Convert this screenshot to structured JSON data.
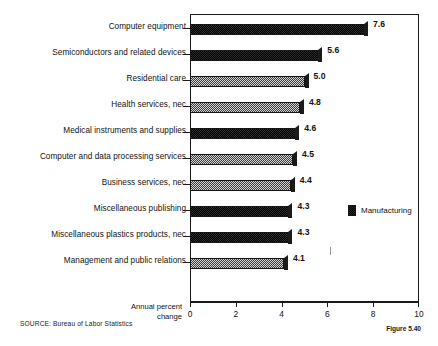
{
  "chart_data": {
    "type": "bar",
    "orientation": "horizontal",
    "title": "",
    "xlabel": "Annual percent change",
    "ylabel": "",
    "xlim": [
      0,
      10
    ],
    "xticks": [
      0,
      2,
      4,
      6,
      8,
      10
    ],
    "grid": false,
    "legend_position": "inside-right",
    "categories": [
      "Computer equipment",
      "Semiconductors and related devices",
      "Residential care",
      "Health services, nec",
      "Medical instruments and supplies",
      "Computer and data processing services",
      "Business services, nec",
      "Miscellaneous publishing",
      "Miscellaneous plastics products, nec",
      "Management and public relations"
    ],
    "values": [
      7.6,
      5.6,
      5.0,
      4.8,
      4.6,
      4.5,
      4.4,
      4.3,
      4.3,
      4.1
    ],
    "value_labels": [
      "7.6",
      "5.6",
      "5.0",
      "4.8",
      "4.6",
      "4.5",
      "4.4",
      "4.3",
      "4.3",
      "4.1"
    ],
    "bar_shading": [
      "dark",
      "dark",
      "light",
      "light",
      "dark",
      "light",
      "light",
      "dark",
      "dark",
      "light"
    ],
    "series": [
      {
        "name": "Manufacturing",
        "values": [
          7.6,
          5.6,
          5.0,
          4.8,
          4.6,
          4.5,
          4.4,
          4.3,
          4.3,
          4.1
        ]
      }
    ]
  },
  "axis": {
    "caption_line1": "Annual percent",
    "caption_line2": "change",
    "tick_labels": [
      "0",
      "2",
      "4",
      "6",
      "8",
      "10"
    ]
  },
  "legend": {
    "label": "Manufacturing"
  },
  "footer": {
    "source": "SOURCE:  Bureau of Labor Statistics",
    "figure_number": "Figure 5.40"
  },
  "colors": {
    "ink": "#111111",
    "frame": "#1a1a1a",
    "bar_dark": "#2b2b2b",
    "bar_light": "#d6d6d6",
    "background": "#ffffff"
  }
}
